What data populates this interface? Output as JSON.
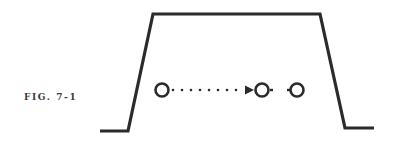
{
  "figure": {
    "label": "FIG. 7-1",
    "stroke_color": "#2b2b2b",
    "background": "#ffffff",
    "shape": "trapezoid-profile",
    "elements": [
      {
        "type": "circle",
        "name": "circle-start"
      },
      {
        "type": "dotted-arrow",
        "name": "motion-arrow",
        "direction": "right"
      },
      {
        "type": "circle",
        "name": "circle-middle"
      },
      {
        "type": "circle",
        "name": "circle-end"
      }
    ]
  }
}
